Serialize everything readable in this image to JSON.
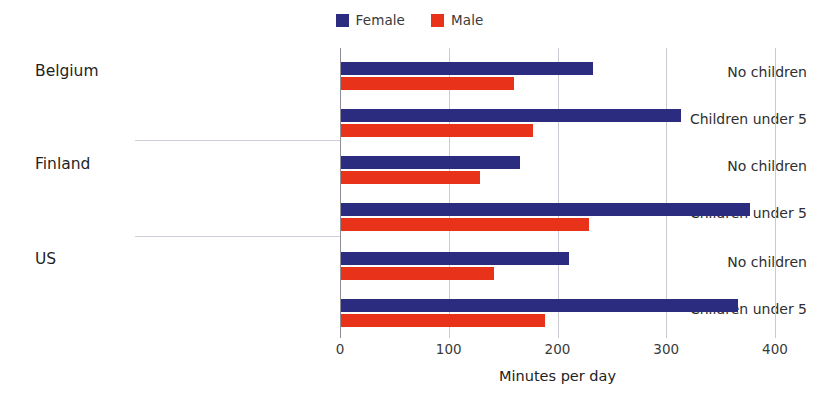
{
  "chart_data": {
    "type": "bar",
    "orientation": "horizontal",
    "title": "",
    "xlabel": "Minutes per day",
    "ylabel": "",
    "xlim": [
      0,
      400
    ],
    "xticks": [
      0,
      100,
      200,
      300,
      400
    ],
    "xtick_labels": [
      "0",
      "100",
      "200",
      "300",
      "400"
    ],
    "grid": "vertical",
    "legend_position": "top-center",
    "legend": [
      {
        "name": "Female",
        "color": "#2b2b80"
      },
      {
        "name": "Male",
        "color": "#e8321a"
      }
    ],
    "groups": [
      {
        "label": "Belgium",
        "rows": [
          {
            "label": "No children",
            "female": 232,
            "male": 159
          },
          {
            "label": "Children under 5",
            "female": 313,
            "male": 177
          }
        ]
      },
      {
        "label": "Finland",
        "rows": [
          {
            "label": "No children",
            "female": 165,
            "male": 128
          },
          {
            "label": "Children under 5",
            "female": 376,
            "male": 228
          }
        ]
      },
      {
        "label": "US",
        "rows": [
          {
            "label": "No children",
            "female": 210,
            "male": 141
          },
          {
            "label": "Children under 5",
            "female": 365,
            "male": 188
          }
        ]
      }
    ],
    "series": [
      {
        "name": "Female",
        "values": [
          232,
          313,
          165,
          376,
          210,
          365
        ]
      },
      {
        "name": "Male",
        "values": [
          159,
          177,
          128,
          228,
          141,
          188
        ]
      }
    ],
    "categories": [
      "Belgium - No children",
      "Belgium - Children under 5",
      "Finland - No children",
      "Finland - Children under 5",
      "US - No children",
      "US - Children under 5"
    ]
  },
  "colors": {
    "female": "#2b2b80",
    "male": "#e8321a",
    "grid": "#c9c9d2",
    "axis": "#8e8e99",
    "separator": "#cfcfd8",
    "text": "#262626",
    "background": "#ffffff"
  }
}
